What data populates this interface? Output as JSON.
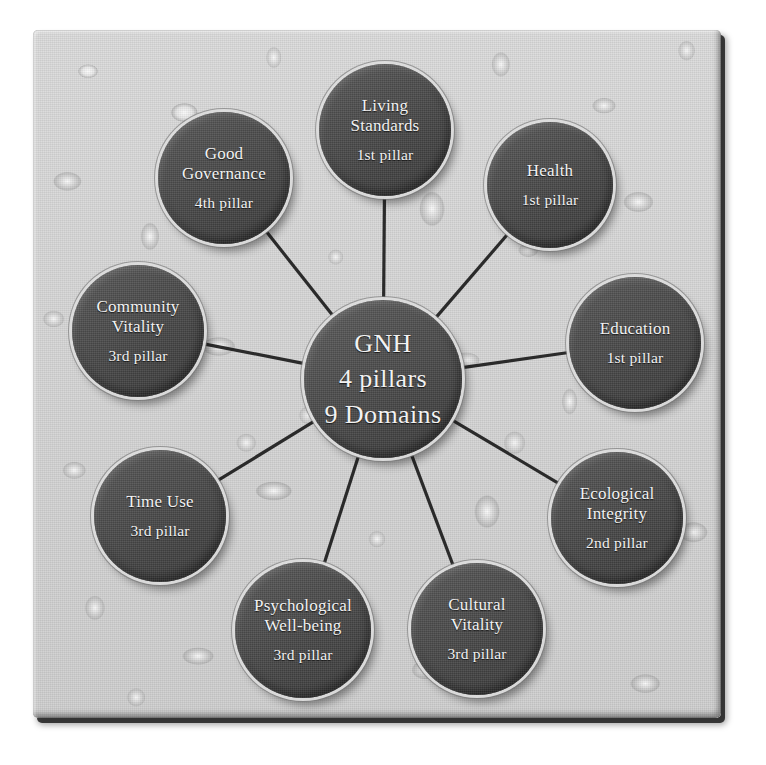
{
  "diagram": {
    "center": {
      "name": "gnh-center",
      "line1": "GNH",
      "line2": "4 pillars",
      "line3": "9 Domains",
      "cx": 383,
      "cy": 379,
      "r": 79
    },
    "colors": {
      "node_fill": "#4a4a4a",
      "node_rim": "#e2e2e2",
      "node_text": "#f2f2f2",
      "link": "#1d1d1d",
      "panel_bg": "#d6d6d6",
      "panel_edge": "#1e1e1e",
      "page_bg": "#ffffff"
    },
    "nodes": [
      {
        "name": "living-standards",
        "title": "Living\nStandards",
        "sub": "1st pillar",
        "cx": 385,
        "cy": 130,
        "r": 66
      },
      {
        "name": "health",
        "title": "Health",
        "sub": "1st pillar",
        "cx": 550,
        "cy": 185,
        "r": 63
      },
      {
        "name": "education",
        "title": "Education",
        "sub": "1st pillar",
        "cx": 635,
        "cy": 343,
        "r": 66
      },
      {
        "name": "ecological-integrity",
        "title": "Ecological\nIntegrity",
        "sub": "2nd pillar",
        "cx": 617,
        "cy": 518,
        "r": 66
      },
      {
        "name": "cultural-vitality",
        "title": "Cultural\nVitality",
        "sub": "3rd pillar",
        "cx": 477,
        "cy": 629,
        "r": 66
      },
      {
        "name": "psychological-well-being",
        "title": "Psychological\nWell-being",
        "sub": "3rd pillar",
        "cx": 303,
        "cy": 630,
        "r": 68
      },
      {
        "name": "time-use",
        "title": "Time Use",
        "sub": "3rd pillar",
        "cx": 160,
        "cy": 516,
        "r": 66
      },
      {
        "name": "community-vitality",
        "title": "Community\nVitality",
        "sub": "3rd pillar",
        "cx": 138,
        "cy": 331,
        "r": 66
      },
      {
        "name": "good-governance",
        "title": "Good\nGovernance",
        "sub": "4th pillar",
        "cx": 224,
        "cy": 178,
        "r": 66
      }
    ]
  },
  "chart_data": {
    "type": "diagram",
    "layout": "radial-hub-and-spoke",
    "hub": "GNH / 4 pillars / 9 Domains",
    "categories": [
      "Living Standards",
      "Health",
      "Education",
      "Ecological Integrity",
      "Cultural Vitality",
      "Psychological Well-being",
      "Time Use",
      "Community Vitality",
      "Good Governance"
    ],
    "values": [
      "1st pillar",
      "1st pillar",
      "1st pillar",
      "2nd pillar",
      "3rd pillar",
      "3rd pillar",
      "3rd pillar",
      "3rd pillar",
      "4th pillar"
    ],
    "edges": [
      [
        "GNH",
        "Living Standards"
      ],
      [
        "GNH",
        "Health"
      ],
      [
        "GNH",
        "Education"
      ],
      [
        "GNH",
        "Ecological Integrity"
      ],
      [
        "GNH",
        "Cultural Vitality"
      ],
      [
        "GNH",
        "Psychological Well-being"
      ],
      [
        "GNH",
        "Time Use"
      ],
      [
        "GNH",
        "Community Vitality"
      ],
      [
        "GNH",
        "Good Governance"
      ]
    ],
    "pillar_counts": {
      "1st pillar": 3,
      "2nd pillar": 1,
      "3rd pillar": 4,
      "4th pillar": 1
    },
    "legend": [],
    "grid": false
  }
}
